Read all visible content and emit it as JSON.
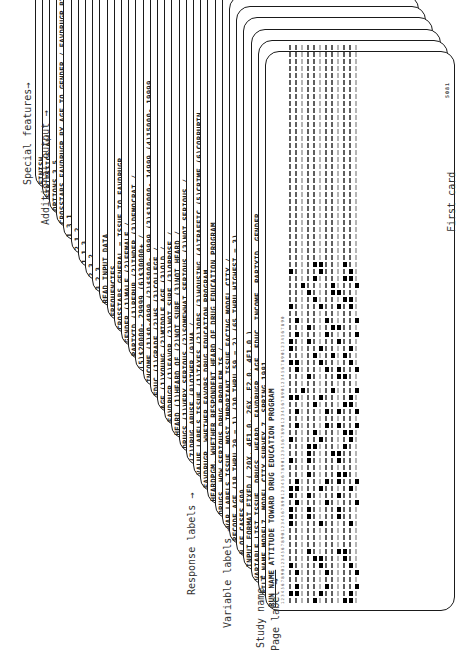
{
  "figure": {
    "first_card_label": "First card",
    "general_purpose_label": "GENERAL PURPOSE-80 FIELD",
    "card_footer_code": "5081"
  },
  "annotations": [
    {
      "label": "Special features",
      "arrow": "→"
    },
    {
      "label": "Additional output",
      "arrow": "→"
    },
    {
      "label": "Response labels",
      "arrow": "→"
    },
    {
      "label": "Variable labels",
      "arrow": "→"
    },
    {
      "label": "Study name",
      "arrow": "→"
    },
    {
      "label": "Page label",
      "arrow": "→"
    }
  ],
  "cards": [
    {
      "keyword": "RUN NAME",
      "content": "ATTITUDE TOWARD DRUG EDUCATION PROGRAM"
    },
    {
      "keyword": "FILE NAME",
      "content": "MODEL7, MODEL CITY SURVEY 7, SPRING 1981"
    },
    {
      "keyword": "VARIABLE LIST",
      "content": "ISSUE, DRUGS, HEARD, FAVDRUGP, AGE, EDUC, INCOME, PARTYID, GENDER"
    },
    {
      "keyword": "INPUT FORMAT",
      "content": "FIXED ( 20X, 4F1.0, 26X, F2.0, 4F1.0 )"
    },
    {
      "keyword": "N OF CASES",
      "content": "600"
    },
    {
      "keyword": "RECODE",
      "content": "AGE (18 THRU 29 = 1) (30 THRU 59 = 2) (65 THRU HIGHEST = 3)"
    },
    {
      "keyword": "VAR LABELS",
      "content": "ISSUE, MOST IMPORTANT ISSUE FACING MODEL CITY /"
    },
    {
      "keyword": "",
      "content": "DRUGS, HOW SERIOUS DRUG PROBLEM IS /"
    },
    {
      "keyword": "",
      "content": "HEARDPGM, WHETHER RESPONDENT HEARD OF DRUG EDUCATION PROGRAM"
    },
    {
      "keyword": "",
      "content": "FAVDRUGP, WHETHER FAVORS DRUG EDUCATION PROGRAM"
    },
    {
      "keyword": "VALUE LABELS",
      "content": "ISSUE (1)TAXES (2)JOBS (3)HOUSING (4)TRAFFIC (5)CRIME (6)CORRUPTN"
    },
    {
      "keyword": "",
      "content": "(7)DRUG ABUSE (8)OTHER (9)NA /"
    },
    {
      "keyword": "",
      "content": "DRUGS (1)VERY SERIOUS (2)SOMEWHAT SERIOUS (3)NOT SERIOUS /"
    },
    {
      "keyword": "",
      "content": "HEARD (1)HEARD OF (2)NOT SURE (3)NOT HEARD /"
    },
    {
      "keyword": "",
      "content": "FAVDRUGP (1)FAVOR (2)NOT SURE (3)OPPOSE /"
    },
    {
      "keyword": "",
      "content": "AGE (1)YOUNG (2)MIDDLE AGE (3)OLD /"
    },
    {
      "keyword": "",
      "content": "EDUC (1)GRADE (2)HS (3)COLLEGE /"
    },
    {
      "keyword": "",
      "content": "INCOME (1)$0-4999 (2)$5000- 9999 (3)$10000- 14999 (4)15000- 19999"
    },
    {
      "keyword": "",
      "content": "(5)$20000- 29999 (6)$30000+ /"
    },
    {
      "keyword": "",
      "content": "PARTYID (1)REPUB (2)INDEP (3)DEMOCRAT /"
    },
    {
      "keyword": "",
      "content": "GENDER (1)MALE (2)FEMALE /"
    },
    {
      "keyword": "CROSSTABS",
      "content": "GENERAL = ISSUE TO FAVDRUGP"
    },
    {
      "keyword": "FREQUENCIES",
      "content": ""
    },
    {
      "keyword": "READ INPUT DATA",
      "content": ""
    },
    {
      "keyword": "",
      "content": "3 2 3"
    },
    {
      "keyword": "",
      "content": "2 3 2"
    },
    {
      "keyword": "",
      "content": "1 1 3"
    },
    {
      "keyword": "",
      "content": "2 1 2"
    },
    {
      "keyword": "",
      "content": "1 3 1"
    },
    {
      "keyword": "CROSSTABS",
      "content": "FAVDRUGP BY AGE TO GENDER / FAVDRUGP BY AGE BY GENDER"
    },
    {
      "keyword": "OPTIONS",
      "content": "3,5"
    },
    {
      "keyword": "STATISTICS",
      "content": "ALL"
    },
    {
      "keyword": "FINISH",
      "content": ""
    }
  ]
}
